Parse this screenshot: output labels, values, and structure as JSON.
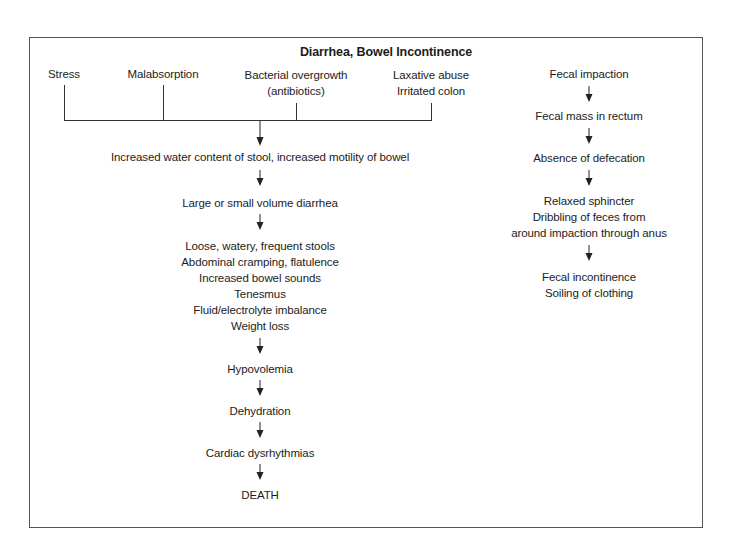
{
  "title": "Diarrhea, Bowel Incontinence",
  "causes": [
    {
      "lines": [
        "Stress"
      ]
    },
    {
      "lines": [
        "Malabsorption"
      ]
    },
    {
      "lines": [
        "Bacterial overgrowth",
        "(antibiotics)"
      ]
    },
    {
      "lines": [
        "Laxative abuse",
        "Irritated colon"
      ]
    }
  ],
  "left_flow": {
    "step1": "Increased water content of stool, increased motility of bowel",
    "step2": "Large or small volume diarrhea",
    "step3": [
      "Loose, watery, frequent stools",
      "Abdominal cramping, flatulence",
      "Increased bowel sounds",
      "Tenesmus",
      "Fluid/electrolyte imbalance",
      "Weight loss"
    ],
    "step4": "Hypovolemia",
    "step5": "Dehydration",
    "step6": "Cardiac dysrhythmias",
    "step7": "DEATH"
  },
  "right_flow": {
    "step1": "Fecal impaction",
    "step2": "Fecal mass in rectum",
    "step3": "Absence of defecation",
    "step4": [
      "Relaxed sphincter",
      "Dribbling of feces from",
      "around impaction through anus"
    ],
    "step5": [
      "Fecal incontinence",
      "Soiling of clothing"
    ]
  },
  "icons": {
    "arrow": "down-arrow-icon"
  },
  "colors": {
    "line": "#333333",
    "border": "#555555",
    "text": "#1c1c1c"
  }
}
